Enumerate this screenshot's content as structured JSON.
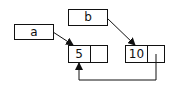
{
  "diagram": {
    "variables": [
      {
        "name": "a",
        "points_to": "node1"
      },
      {
        "name": "b",
        "points_to": "node2"
      }
    ],
    "nodes": [
      {
        "id": "node1",
        "value": "5",
        "next": null
      },
      {
        "id": "node2",
        "value": "10",
        "next": "node1"
      }
    ],
    "colors": {
      "stroke": "#111111",
      "background": "#ffffff"
    }
  }
}
